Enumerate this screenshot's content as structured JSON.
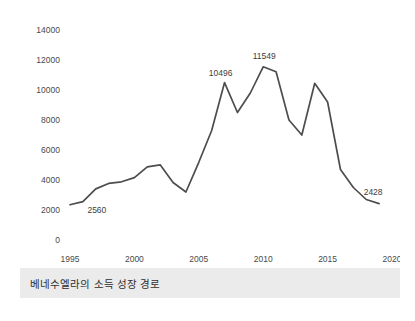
{
  "caption": {
    "text": "베네수엘라의 소득 성장 경로"
  },
  "colors": {
    "line": "#4d4d4d",
    "caption_bar": "#ebebeb",
    "tick_text": "#4a4a4a",
    "label_text": "#3d3d3d",
    "card_background": "#ffffff",
    "page_background": "#ffffff"
  },
  "chart_data": {
    "type": "line",
    "title": "",
    "subtitle": "",
    "xlabel": "",
    "ylabel": "",
    "xlim": [
      1995,
      2020
    ],
    "ylim": [
      0,
      14000
    ],
    "grid": false,
    "legend": false,
    "legend_position": "none",
    "y_ticks": [
      0,
      2000,
      4000,
      6000,
      8000,
      10000,
      12000,
      14000
    ],
    "y_tick_labels": [
      "0",
      "2000",
      "4000",
      "6000",
      "8000",
      "10000",
      "12000",
      "14000"
    ],
    "x_ticks": [
      1995,
      2000,
      2005,
      2010,
      2015,
      2020
    ],
    "x_tick_labels": [
      "1995",
      "2000",
      "2005",
      "2010",
      "2015",
      "2020"
    ],
    "series": [
      {
        "name": "베네수엘라 1인당 소득",
        "x": [
          1995,
          1996,
          1997,
          1998,
          1999,
          2000,
          2001,
          2002,
          2003,
          2004,
          2005,
          2006,
          2007,
          2008,
          2009,
          2010,
          2011,
          2012,
          2013,
          2014,
          2015,
          2016,
          2017,
          2018,
          2019
        ],
        "values": [
          2350,
          2560,
          3410,
          3770,
          3880,
          4160,
          4880,
          5010,
          3830,
          3200,
          5180,
          7300,
          10496,
          8500,
          9800,
          11549,
          11220,
          8000,
          7000,
          10450,
          9200,
          4700,
          3500,
          2700,
          2428
        ]
      }
    ],
    "annotations": [
      {
        "label": "2560",
        "x": 1996,
        "y": 2560,
        "dx": 14,
        "dy": 11
      },
      {
        "label": "10496",
        "x": 2007,
        "y": 10496,
        "dx": -4,
        "dy": -7
      },
      {
        "label": "11549",
        "x": 2010,
        "y": 11549,
        "dx": 1,
        "dy": -8
      },
      {
        "label": "2428",
        "x": 2019,
        "y": 2428,
        "dx": -6,
        "dy": -9
      }
    ]
  }
}
